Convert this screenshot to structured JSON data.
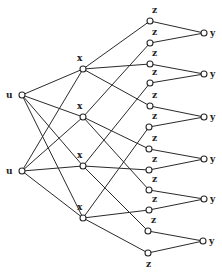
{
  "diagram": {
    "type": "layered-network",
    "colors": {
      "stroke": "#2a2a2a",
      "node_fill": "#ffffff",
      "label": "#222222",
      "background": "#ffffff"
    },
    "nodes": [
      {
        "id": "u1",
        "label": "u",
        "x": 22,
        "y": 95,
        "lx": 6,
        "ly": 98
      },
      {
        "id": "u2",
        "label": "u",
        "x": 22,
        "y": 171,
        "lx": 6,
        "ly": 174
      },
      {
        "id": "x1",
        "label": "x",
        "x": 83,
        "y": 69,
        "lx": 77,
        "ly": 61
      },
      {
        "id": "x2",
        "label": "x",
        "x": 83,
        "y": 117,
        "lx": 77,
        "ly": 109
      },
      {
        "id": "x3",
        "label": "x",
        "x": 83,
        "y": 166,
        "lx": 77,
        "ly": 158
      },
      {
        "id": "x4",
        "label": "x",
        "x": 83,
        "y": 218,
        "lx": 77,
        "ly": 210
      },
      {
        "id": "z1",
        "label": "z",
        "x": 150,
        "y": 21,
        "lx": 152,
        "ly": 13
      },
      {
        "id": "z2",
        "label": "z",
        "x": 150,
        "y": 43,
        "lx": 152,
        "ly": 35
      },
      {
        "id": "z3",
        "label": "z",
        "x": 150,
        "y": 64,
        "lx": 152,
        "ly": 56
      },
      {
        "id": "z4",
        "label": "z",
        "x": 150,
        "y": 83,
        "lx": 152,
        "ly": 75
      },
      {
        "id": "z5",
        "label": "z",
        "x": 150,
        "y": 106,
        "lx": 152,
        "ly": 98
      },
      {
        "id": "z6",
        "label": "z",
        "x": 149,
        "y": 127,
        "lx": 152,
        "ly": 119
      },
      {
        "id": "z7",
        "label": "z",
        "x": 149,
        "y": 149,
        "lx": 152,
        "ly": 141
      },
      {
        "id": "z8",
        "label": "z",
        "x": 149,
        "y": 170,
        "lx": 152,
        "ly": 162
      },
      {
        "id": "z9",
        "label": "z",
        "x": 149,
        "y": 190,
        "lx": 152,
        "ly": 182
      },
      {
        "id": "z10",
        "label": "z",
        "x": 149,
        "y": 210,
        "lx": 152,
        "ly": 202
      },
      {
        "id": "z11",
        "label": "z",
        "x": 148,
        "y": 231,
        "lx": 151,
        "ly": 223
      },
      {
        "id": "z12",
        "label": "z",
        "x": 148,
        "y": 253,
        "lx": 146,
        "ly": 267
      },
      {
        "id": "y1",
        "label": "y",
        "x": 204,
        "y": 33,
        "lx": 210,
        "ly": 36
      },
      {
        "id": "y2",
        "label": "y",
        "x": 204,
        "y": 74,
        "lx": 210,
        "ly": 77
      },
      {
        "id": "y3",
        "label": "y",
        "x": 204,
        "y": 117,
        "lx": 210,
        "ly": 120
      },
      {
        "id": "y4",
        "label": "y",
        "x": 204,
        "y": 159,
        "lx": 210,
        "ly": 162
      },
      {
        "id": "y5",
        "label": "y",
        "x": 204,
        "y": 199,
        "lx": 210,
        "ly": 202
      },
      {
        "id": "y6",
        "label": "y",
        "x": 203,
        "y": 241,
        "lx": 209,
        "ly": 244
      }
    ],
    "edges": [
      [
        "u1",
        "x1"
      ],
      [
        "u1",
        "x2"
      ],
      [
        "u1",
        "x3"
      ],
      [
        "u1",
        "x4"
      ],
      [
        "u2",
        "x1"
      ],
      [
        "u2",
        "x2"
      ],
      [
        "u2",
        "x3"
      ],
      [
        "u2",
        "x4"
      ],
      [
        "x1",
        "z1"
      ],
      [
        "x1",
        "z3"
      ],
      [
        "x1",
        "z5"
      ],
      [
        "x2",
        "z2"
      ],
      [
        "x2",
        "z7"
      ],
      [
        "x2",
        "z9"
      ],
      [
        "x3",
        "z4"
      ],
      [
        "x3",
        "z8"
      ],
      [
        "x3",
        "z11"
      ],
      [
        "x4",
        "z6"
      ],
      [
        "x4",
        "z10"
      ],
      [
        "x4",
        "z12"
      ],
      [
        "z1",
        "y1"
      ],
      [
        "z2",
        "y1"
      ],
      [
        "z3",
        "y2"
      ],
      [
        "z4",
        "y2"
      ],
      [
        "z5",
        "y3"
      ],
      [
        "z6",
        "y3"
      ],
      [
        "z7",
        "y4"
      ],
      [
        "z8",
        "y4"
      ],
      [
        "z9",
        "y5"
      ],
      [
        "z10",
        "y5"
      ],
      [
        "z11",
        "y6"
      ],
      [
        "z12",
        "y6"
      ]
    ]
  }
}
